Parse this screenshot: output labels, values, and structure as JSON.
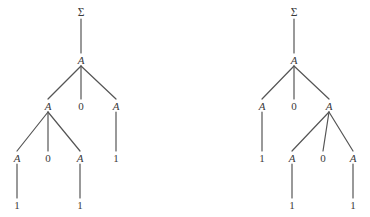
{
  "figure": {
    "name": "two-parse-trees",
    "stroke_color": "#555555",
    "text_color": "#3a3a3a",
    "background_color": "#ffffff"
  },
  "trees": [
    {
      "id": "left-tree",
      "name": "left-parse-tree",
      "nodes": [
        {
          "id": "L0",
          "label": "Σ",
          "kind": "start-symbol",
          "x": 81,
          "y": 13
        },
        {
          "id": "L1",
          "label": "A",
          "kind": "nonterminal",
          "x": 81,
          "y": 60
        },
        {
          "id": "L2",
          "label": "A",
          "kind": "nonterminal",
          "x": 48,
          "y": 106
        },
        {
          "id": "L3",
          "label": "0",
          "kind": "terminal",
          "x": 81,
          "y": 106
        },
        {
          "id": "L4",
          "label": "A",
          "kind": "nonterminal",
          "x": 116,
          "y": 106
        },
        {
          "id": "L5",
          "label": "A",
          "kind": "nonterminal",
          "x": 17,
          "y": 158
        },
        {
          "id": "L6",
          "label": "0",
          "kind": "terminal",
          "x": 48,
          "y": 158
        },
        {
          "id": "L7",
          "label": "A",
          "kind": "nonterminal",
          "x": 80,
          "y": 158
        },
        {
          "id": "L8",
          "label": "1",
          "kind": "terminal",
          "x": 116,
          "y": 158
        },
        {
          "id": "L9",
          "label": "1",
          "kind": "terminal",
          "x": 17,
          "y": 205
        },
        {
          "id": "L10",
          "label": "1",
          "kind": "terminal",
          "x": 80,
          "y": 205
        }
      ],
      "edges": [
        {
          "from": "L0",
          "to": "L1"
        },
        {
          "from": "L1",
          "to": "L2"
        },
        {
          "from": "L1",
          "to": "L3"
        },
        {
          "from": "L1",
          "to": "L4"
        },
        {
          "from": "L2",
          "to": "L5"
        },
        {
          "from": "L2",
          "to": "L6"
        },
        {
          "from": "L2",
          "to": "L7"
        },
        {
          "from": "L4",
          "to": "L8"
        },
        {
          "from": "L5",
          "to": "L9"
        },
        {
          "from": "L7",
          "to": "L10"
        }
      ]
    },
    {
      "id": "right-tree",
      "name": "right-parse-tree",
      "nodes": [
        {
          "id": "R0",
          "label": "Σ",
          "kind": "start-symbol",
          "x": 294,
          "y": 13
        },
        {
          "id": "R1",
          "label": "A",
          "kind": "nonterminal",
          "x": 294,
          "y": 60
        },
        {
          "id": "R2",
          "label": "A",
          "kind": "nonterminal",
          "x": 262,
          "y": 106
        },
        {
          "id": "R3",
          "label": "0",
          "kind": "terminal",
          "x": 294,
          "y": 106
        },
        {
          "id": "R4",
          "label": "A",
          "kind": "nonterminal",
          "x": 329,
          "y": 106
        },
        {
          "id": "R5",
          "label": "1",
          "kind": "terminal",
          "x": 262,
          "y": 158
        },
        {
          "id": "R6",
          "label": "A",
          "kind": "nonterminal",
          "x": 292,
          "y": 158
        },
        {
          "id": "R7",
          "label": "0",
          "kind": "terminal",
          "x": 323,
          "y": 158
        },
        {
          "id": "R8",
          "label": "A",
          "kind": "nonterminal",
          "x": 353,
          "y": 158
        },
        {
          "id": "R9",
          "label": "1",
          "kind": "terminal",
          "x": 292,
          "y": 205
        },
        {
          "id": "R10",
          "label": "1",
          "kind": "terminal",
          "x": 353,
          "y": 205
        }
      ],
      "edges": [
        {
          "from": "R0",
          "to": "R1"
        },
        {
          "from": "R1",
          "to": "R2"
        },
        {
          "from": "R1",
          "to": "R3"
        },
        {
          "from": "R1",
          "to": "R4"
        },
        {
          "from": "R2",
          "to": "R5"
        },
        {
          "from": "R4",
          "to": "R6"
        },
        {
          "from": "R4",
          "to": "R7"
        },
        {
          "from": "R4",
          "to": "R8"
        },
        {
          "from": "R6",
          "to": "R9"
        },
        {
          "from": "R8",
          "to": "R10"
        }
      ]
    }
  ]
}
